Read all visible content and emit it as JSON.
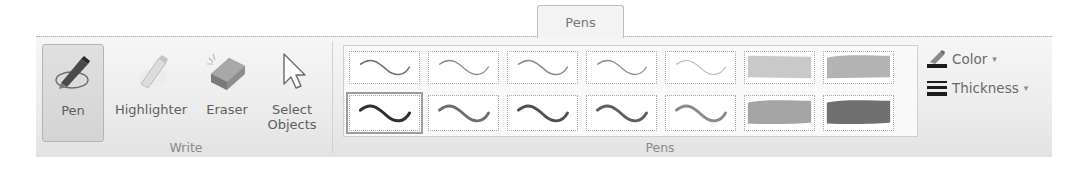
{
  "tab": {
    "label": "Pens"
  },
  "groups": {
    "write": {
      "label": "Write",
      "buttons": [
        {
          "id": "pen",
          "label": "Pen",
          "icon": "pen-icon",
          "selected": true
        },
        {
          "id": "highlighter",
          "label": "Highlighter",
          "icon": "highlighter-icon",
          "selected": false
        },
        {
          "id": "eraser",
          "label": "Eraser",
          "icon": "eraser-icon",
          "selected": false
        },
        {
          "id": "select-objects",
          "label_line1": "Select",
          "label_line2": "Objects",
          "icon": "cursor-arrow-icon",
          "selected": false
        }
      ]
    },
    "pens": {
      "label": "Pens",
      "gallery": {
        "rows": [
          [
            {
              "type": "pen",
              "color": "#6e6e6e",
              "width": 1.6
            },
            {
              "type": "pen",
              "color": "#8a8a8a",
              "width": 1.4
            },
            {
              "type": "pen",
              "color": "#8a8a8a",
              "width": 1.6
            },
            {
              "type": "pen",
              "color": "#8e8e8e",
              "width": 1.4
            },
            {
              "type": "pen",
              "color": "#b5b5b5",
              "width": 1.2
            },
            {
              "type": "highlighter",
              "color": "#c9c9c9"
            },
            {
              "type": "highlighter",
              "color": "#b3b3b3"
            }
          ],
          [
            {
              "type": "pen",
              "color": "#2f2f2f",
              "width": 3.2,
              "selected": true
            },
            {
              "type": "pen",
              "color": "#6f6f6f",
              "width": 3
            },
            {
              "type": "pen",
              "color": "#4f4f4f",
              "width": 3
            },
            {
              "type": "pen",
              "color": "#5e5e5e",
              "width": 3
            },
            {
              "type": "pen",
              "color": "#8a8a8a",
              "width": 3
            },
            {
              "type": "highlighter",
              "color": "#a4a4a4"
            },
            {
              "type": "highlighter",
              "color": "#6f6f6f"
            }
          ]
        ],
        "scroll": {
          "up": "▲",
          "down": "▼",
          "more": "▾"
        }
      },
      "color_button": {
        "label": "Color",
        "icon": "pen-color-icon",
        "caret": "▾"
      },
      "thickness_button": {
        "label": "Thickness",
        "icon": "line-thickness-icon",
        "caret": "▾"
      }
    }
  }
}
